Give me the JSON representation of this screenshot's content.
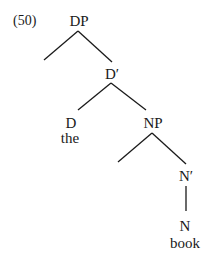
{
  "example_number": "(50)",
  "tree": {
    "root": "DP",
    "d_bar": "D′",
    "d": "D",
    "d_word": "the",
    "np": "NP",
    "n_bar": "N′",
    "n": "N",
    "n_word": "book"
  },
  "line_color": "#1a1a1a"
}
